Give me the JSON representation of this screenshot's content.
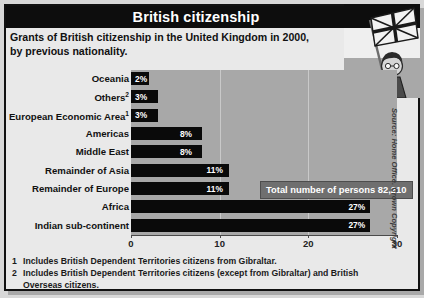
{
  "header": {
    "title": "British citizenship"
  },
  "subtitle": "Grants of British citizenship in the United Kingdom in 2000, by previous nationality.",
  "callout": {
    "label": "Total number of persons 82,210"
  },
  "source": {
    "text": "Source: Home Office. Crown Copyright"
  },
  "footnotes": [
    {
      "num": "1",
      "text": "Includes British Dependent Territories citizens from Gibraltar."
    },
    {
      "num": "2",
      "text": "Includes British Dependent Territories citizens (except from Gibraltar) and British Overseas citizens."
    }
  ],
  "illustration": {
    "name": "man-waving-union-jack-flag"
  },
  "colors": {
    "header_background": "#0d0d0d",
    "header_text": "#ffffff",
    "plot_background": "#a8a8a8",
    "bar": "#0a0a0a",
    "bar_value_text": "#ffffff",
    "callout_background": "#6f6f6f",
    "frame": "#111111",
    "card_background": "#e9e9e9"
  },
  "chart_data": {
    "type": "bar",
    "orientation": "horizontal",
    "title": "British citizenship",
    "subtitle": "Grants of British citizenship in the United Kingdom in 2000, by previous nationality.",
    "xlabel": "",
    "ylabel": "",
    "xlim": [
      0,
      30
    ],
    "xticks": [
      0,
      10,
      20,
      30
    ],
    "xtick_labels": [
      "0",
      "10",
      "20",
      "30"
    ],
    "grid": true,
    "legend": "none",
    "unit": "%",
    "categories": [
      "Oceania",
      "Others",
      "European Economic Area",
      "Americas",
      "Middle East",
      "Remainder of Asia",
      "Remainder of Europe",
      "Africa",
      "Indian sub-continent"
    ],
    "category_footnote_markers": [
      "",
      "2",
      "1",
      "",
      "",
      "",
      "",
      "",
      ""
    ],
    "values": [
      2,
      3,
      3,
      8,
      8,
      11,
      11,
      27,
      27
    ],
    "data_labels": [
      "2%",
      "3%",
      "3%",
      "8%",
      "8%",
      "11%",
      "11%",
      "27%",
      "27%"
    ],
    "annotations": [
      "Total number of persons 82,210"
    ]
  }
}
